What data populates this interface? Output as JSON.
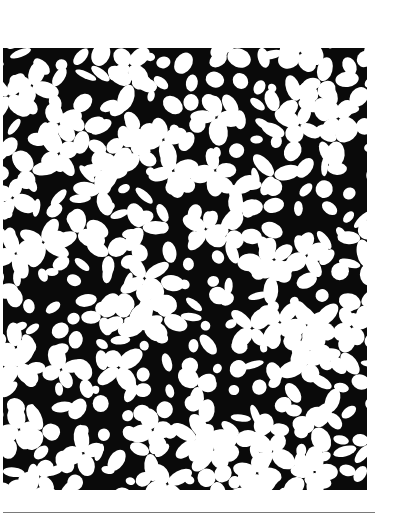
{
  "illustration": {
    "description": "Dense pattern of white oval petals forming clover-like clusters on a black ground",
    "colors": {
      "ground": "#0a0a0a",
      "petal": "#ffffff",
      "rule": "#7a7a7a",
      "page": "#ffffff"
    },
    "frame": {
      "x": 3,
      "y": 48,
      "width": 364,
      "height": 442
    },
    "rule": {
      "x": 3,
      "y": 512,
      "width": 372
    },
    "seed": 7,
    "cell": 22
  }
}
